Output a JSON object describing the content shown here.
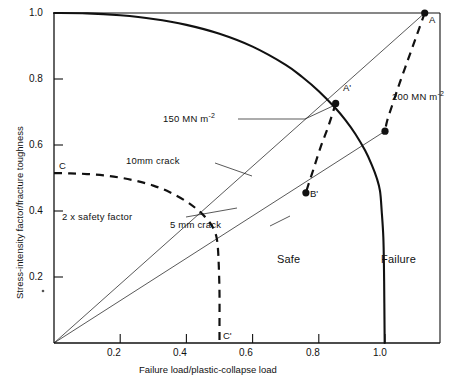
{
  "chart_data": {
    "type": "line",
    "title": "",
    "xlabel": "Failure load/plastic-collapse load",
    "ylabel": "Stress-intensity factor/fracture toughness",
    "xlim": [
      0,
      1.167
    ],
    "ylim": [
      0,
      1.0
    ],
    "xticks": [
      "0.2",
      "0.4",
      "0.6",
      "0.8",
      "1.0"
    ],
    "xtick_values": [
      0.2,
      0.4,
      0.6,
      0.8,
      1.0
    ],
    "yticks": [
      "0.2",
      "0.4",
      "0.6",
      "0.8",
      "1.0"
    ],
    "ytick_values": [
      0.2,
      0.4,
      0.6,
      0.8,
      1.0
    ],
    "grid": false,
    "legend": "none",
    "series": [
      {
        "name": "failure-assessment-curve",
        "style": "solid",
        "points": [
          [
            0.0,
            1.0
          ],
          [
            0.1,
            0.999
          ],
          [
            0.2,
            0.993
          ],
          [
            0.3,
            0.982
          ],
          [
            0.4,
            0.964
          ],
          [
            0.5,
            0.937
          ],
          [
            0.6,
            0.898
          ],
          [
            0.7,
            0.843
          ],
          [
            0.75,
            0.806
          ],
          [
            0.8,
            0.763
          ],
          [
            0.85,
            0.712
          ],
          [
            0.88,
            0.676
          ],
          [
            0.91,
            0.634
          ],
          [
            0.94,
            0.583
          ],
          [
            0.96,
            0.54
          ],
          [
            0.975,
            0.5
          ],
          [
            0.985,
            0.46
          ],
          [
            0.99,
            0.4
          ],
          [
            0.995,
            0.32
          ],
          [
            0.997,
            0.22
          ],
          [
            0.998,
            0.12
          ],
          [
            0.999,
            0.0
          ]
        ]
      },
      {
        "name": "two-times-safety-factor-curve",
        "style": "dashed",
        "points": [
          [
            0.0,
            0.515
          ],
          [
            0.05,
            0.514
          ],
          [
            0.1,
            0.512
          ],
          [
            0.15,
            0.508
          ],
          [
            0.2,
            0.501
          ],
          [
            0.25,
            0.491
          ],
          [
            0.3,
            0.477
          ],
          [
            0.35,
            0.457
          ],
          [
            0.4,
            0.429
          ],
          [
            0.43,
            0.407
          ],
          [
            0.45,
            0.389
          ],
          [
            0.47,
            0.366
          ],
          [
            0.48,
            0.35
          ],
          [
            0.49,
            0.325
          ],
          [
            0.495,
            0.29
          ],
          [
            0.498,
            0.23
          ],
          [
            0.5,
            0.15
          ],
          [
            0.5,
            0.06
          ],
          [
            0.5,
            0.0
          ]
        ]
      },
      {
        "name": "locus-150-MNm-2",
        "style": "dashed",
        "points": [
          [
            0.851,
            0.726
          ],
          [
            0.83,
            0.66
          ],
          [
            0.806,
            0.595
          ],
          [
            0.785,
            0.53
          ],
          [
            0.768,
            0.478
          ],
          [
            0.761,
            0.455
          ]
        ]
      },
      {
        "name": "locus-200-MNm-2",
        "style": "dashed",
        "points": [
          [
            1.12,
            1.0
          ],
          [
            1.095,
            0.93
          ],
          [
            1.07,
            0.86
          ],
          [
            1.045,
            0.79
          ],
          [
            1.025,
            0.73
          ],
          [
            1.007,
            0.675
          ],
          [
            1.0,
            0.642
          ]
        ]
      },
      {
        "name": "radial-line-10mm-crack",
        "style": "thin-solid",
        "points": [
          [
            0.0,
            0.0
          ],
          [
            1.12,
            1.0
          ]
        ]
      },
      {
        "name": "radial-line-5mm-crack",
        "style": "thin-solid",
        "points": [
          [
            0.0,
            0.0
          ],
          [
            1.0,
            0.642
          ]
        ]
      }
    ],
    "annotations": [
      {
        "name": "point-A",
        "label": "A",
        "x": 1.12,
        "y": 1.0,
        "marker": "filled-circle"
      },
      {
        "name": "point-A-prime",
        "label": "A'",
        "x": 0.851,
        "y": 0.726,
        "marker": "filled-circle"
      },
      {
        "name": "point-B-prime",
        "label": "B'",
        "x": 0.761,
        "y": 0.455,
        "marker": "filled-circle"
      },
      {
        "name": "point-200-lower",
        "label": "",
        "x": 1.0,
        "y": 0.642,
        "marker": "filled-circle"
      },
      {
        "name": "point-C",
        "label": "C",
        "x": 0.0,
        "y": 0.515,
        "marker": "none"
      },
      {
        "name": "point-C-prime",
        "label": "C'",
        "x": 0.5,
        "y": 0.0,
        "marker": "none"
      }
    ],
    "text_labels": {
      "stress_150": "150 MN m",
      "stress_150_exp": "-2",
      "stress_200": "200 MN m",
      "stress_200_exp": "-2",
      "crack_10mm": "10mm crack",
      "crack_5mm": "5 mm crack",
      "safety_factor": "2 x safety factor",
      "region_safe": "Safe",
      "region_failure": "Failure"
    }
  },
  "axes": {
    "x_title": "Failure load/plastic-collapse load",
    "y_title": "Stress-intensity factor/fracture toughness"
  }
}
